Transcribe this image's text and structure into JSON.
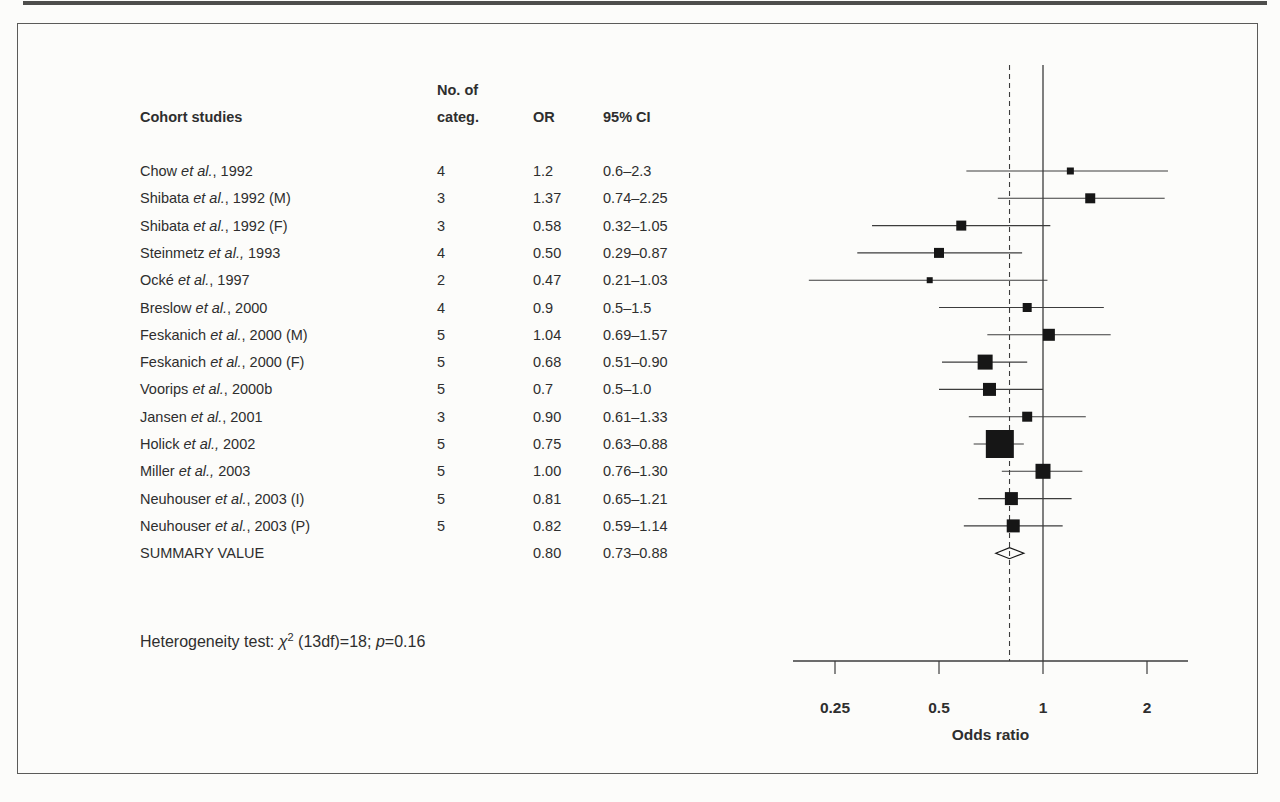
{
  "figure": {
    "table": {
      "header": {
        "study": "Cohort studies",
        "categ_line1": "No. of",
        "categ_line2": "categ.",
        "or": "OR",
        "ci": "95% CI"
      },
      "rows": [
        {
          "name_pre": "Chow ",
          "name_etal": "et al.",
          "name_suf": ", 1992",
          "categ": "4",
          "or": "1.2",
          "ci": "0.6–2.3"
        },
        {
          "name_pre": "Shibata ",
          "name_etal": "et al.",
          "name_suf": ", 1992 (M)",
          "categ": "3",
          "or": "1.37",
          "ci": "0.74–2.25"
        },
        {
          "name_pre": "Shibata ",
          "name_etal": "et al.",
          "name_suf": ", 1992 (F)",
          "categ": "3",
          "or": "0.58",
          "ci": "0.32–1.05"
        },
        {
          "name_pre": "Steinmetz ",
          "name_etal": "et al.,",
          "name_suf": " 1993",
          "categ": "4",
          "or": "0.50",
          "ci": "0.29–0.87"
        },
        {
          "name_pre": "Ocké ",
          "name_etal": "et al.",
          "name_suf": ", 1997",
          "categ": "2",
          "or": "0.47",
          "ci": "0.21–1.03"
        },
        {
          "name_pre": "Breslow ",
          "name_etal": "et al.",
          "name_suf": ", 2000",
          "categ": "4",
          "or": "0.9",
          "ci": "0.5–1.5"
        },
        {
          "name_pre": "Feskanich ",
          "name_etal": "et al.",
          "name_suf": ", 2000 (M)",
          "categ": "5",
          "or": "1.04",
          "ci": "0.69–1.57"
        },
        {
          "name_pre": "Feskanich ",
          "name_etal": "et al.",
          "name_suf": ", 2000 (F)",
          "categ": "5",
          "or": "0.68",
          "ci": "0.51–0.90"
        },
        {
          "name_pre": "Voorips ",
          "name_etal": "et al.",
          "name_suf": ", 2000b",
          "categ": "5",
          "or": "0.7",
          "ci": "0.5–1.0"
        },
        {
          "name_pre": "Jansen ",
          "name_etal": "et al.",
          "name_suf": ", 2001",
          "categ": "3",
          "or": "0.90",
          "ci": "0.61–1.33"
        },
        {
          "name_pre": "Holick ",
          "name_etal": "et al.,",
          "name_suf": " 2002",
          "categ": "5",
          "or": "0.75",
          "ci": "0.63–0.88"
        },
        {
          "name_pre": "Miller ",
          "name_etal": "et al.,",
          "name_suf": " 2003",
          "categ": "5",
          "or": "1.00",
          "ci": "0.76–1.30"
        },
        {
          "name_pre": "Neuhouser ",
          "name_etal": "et al.",
          "name_suf": ", 2003 (I)",
          "categ": "5",
          "or": "0.81",
          "ci": "0.65–1.21"
        },
        {
          "name_pre": "Neuhouser ",
          "name_etal": "et al.",
          "name_suf": ", 2003 (P)",
          "categ": "5",
          "or": "0.82",
          "ci": "0.59–1.14"
        }
      ],
      "summary": {
        "label": "SUMMARY VALUE",
        "or": "0.80",
        "ci": "0.73–0.88"
      }
    },
    "footnote": {
      "label": "Heterogeneity test:  ",
      "chi": "χ",
      "chi_sup": "2",
      "mid": " (13df)=18; ",
      "p": "p",
      "tail": "=0.16"
    }
  },
  "chart_data": {
    "type": "scatter",
    "subtype": "forest-plot",
    "title": "",
    "xlabel": "Odds ratio",
    "x_scale": "log2",
    "x_ticks": [
      0.25,
      0.5,
      1,
      2
    ],
    "x_range": [
      0.19,
      2.6
    ],
    "grid": false,
    "reference_line": {
      "value": 1.0,
      "style": "solid"
    },
    "summary_reference_line": {
      "value": 0.8,
      "style": "dashed"
    },
    "series": [
      {
        "label": "Chow et al., 1992",
        "or": 1.2,
        "ci_low": 0.6,
        "ci_high": 2.3,
        "marker_px": 7
      },
      {
        "label": "Shibata et al., 1992 (M)",
        "or": 1.37,
        "ci_low": 0.74,
        "ci_high": 2.25,
        "marker_px": 10
      },
      {
        "label": "Shibata et al., 1992 (F)",
        "or": 0.58,
        "ci_low": 0.32,
        "ci_high": 1.05,
        "marker_px": 10
      },
      {
        "label": "Steinmetz et al., 1993",
        "or": 0.5,
        "ci_low": 0.29,
        "ci_high": 0.87,
        "marker_px": 10
      },
      {
        "label": "Ocké et al., 1997",
        "or": 0.47,
        "ci_low": 0.21,
        "ci_high": 1.03,
        "marker_px": 6
      },
      {
        "label": "Breslow et al., 2000",
        "or": 0.9,
        "ci_low": 0.5,
        "ci_high": 1.5,
        "marker_px": 9
      },
      {
        "label": "Feskanich et al., 2000 (M)",
        "or": 1.04,
        "ci_low": 0.69,
        "ci_high": 1.57,
        "marker_px": 12
      },
      {
        "label": "Feskanich et al., 2000 (F)",
        "or": 0.68,
        "ci_low": 0.51,
        "ci_high": 0.9,
        "marker_px": 15
      },
      {
        "label": "Voorips et al., 2000b",
        "or": 0.7,
        "ci_low": 0.5,
        "ci_high": 1.0,
        "marker_px": 13
      },
      {
        "label": "Jansen et al., 2001",
        "or": 0.9,
        "ci_low": 0.61,
        "ci_high": 1.33,
        "marker_px": 10
      },
      {
        "label": "Holick et al., 2002",
        "or": 0.75,
        "ci_low": 0.63,
        "ci_high": 0.88,
        "marker_px": 28
      },
      {
        "label": "Miller et al., 2003",
        "or": 1.0,
        "ci_low": 0.76,
        "ci_high": 1.3,
        "marker_px": 15
      },
      {
        "label": "Neuhouser et al., 2003 (I)",
        "or": 0.81,
        "ci_low": 0.65,
        "ci_high": 1.21,
        "marker_px": 13
      },
      {
        "label": "Neuhouser et al., 2003 (P)",
        "or": 0.82,
        "ci_low": 0.59,
        "ci_high": 1.14,
        "marker_px": 13
      }
    ],
    "summary": {
      "label": "SUMMARY VALUE",
      "or": 0.8,
      "ci_low": 0.73,
      "ci_high": 0.88,
      "marker": "open-diamond"
    },
    "annotations": [
      "Heterogeneity test: χ2 (13df)=18; p=0.16"
    ],
    "colors": {
      "marker": "#161616",
      "line": "#3c3c3c",
      "text": "#2e2e2e",
      "background": "#fcfcfa",
      "frame": "#5b5b59"
    }
  }
}
